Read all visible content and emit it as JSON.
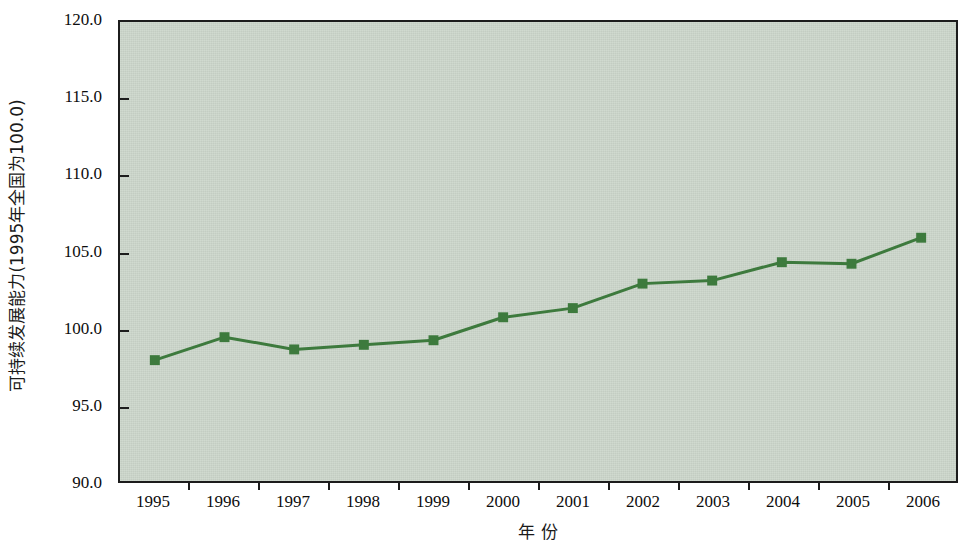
{
  "chart_data": {
    "type": "line",
    "title": "",
    "subtitle": "",
    "xlabel": "年  份",
    "ylabel": "可持续发展能力(1995年全国为100.0)",
    "categories": [
      "1995",
      "1996",
      "1997",
      "1998",
      "1999",
      "2000",
      "2001",
      "2002",
      "2003",
      "2004",
      "2005",
      "2006"
    ],
    "x": [
      1995,
      1996,
      1997,
      1998,
      1999,
      2000,
      2001,
      2002,
      2003,
      2004,
      2005,
      2006
    ],
    "values": [
      97.9,
      99.4,
      98.6,
      98.9,
      99.2,
      100.7,
      101.3,
      102.9,
      103.1,
      104.3,
      104.2,
      105.9
    ],
    "series": [
      {
        "name": "可持续发展能力",
        "values": [
          97.9,
          99.4,
          98.6,
          98.9,
          99.2,
          100.7,
          101.3,
          102.9,
          103.1,
          104.3,
          104.2,
          105.9
        ]
      }
    ],
    "ylim": [
      90.0,
      120.0
    ],
    "ytick_values": [
      90.0,
      95.0,
      100.0,
      105.0,
      110.0,
      115.0,
      120.0
    ],
    "ytick_labels": [
      "90.0",
      "95.0",
      "100.0",
      "105.0",
      "110.0",
      "115.0",
      "120.0"
    ],
    "xtick_labels": [
      "1995",
      "1996",
      "1997",
      "1998",
      "1999",
      "2000",
      "2001",
      "2002",
      "2003",
      "2004",
      "2005",
      "2006"
    ],
    "grid": false,
    "legend": false,
    "legend_position": "none",
    "marker": "square",
    "colors": {
      "plot_background": "#ccd6cb",
      "axis": "#1c1c1c",
      "series_line": "#3d7a3d",
      "series_marker": "#3d7a3d",
      "page_background": "#ffffff",
      "tick_text": "#0d0d0d"
    }
  }
}
